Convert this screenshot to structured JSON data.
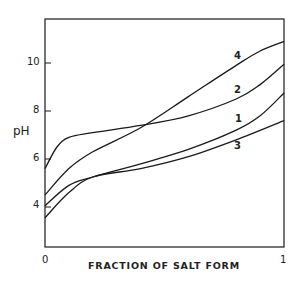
{
  "chart_data": {
    "type": "line",
    "title": "",
    "xlabel": "FRACTION OF SALT FORM",
    "ylabel": "pH",
    "xlim": [
      0,
      1
    ],
    "ylim": [
      2.3,
      11.8
    ],
    "grid": false,
    "legend": "inline curve labels near right end",
    "x_ticks": [
      "0",
      "1"
    ],
    "y_ticks": [
      "4",
      "6",
      "8",
      "10"
    ],
    "series": [
      {
        "name": "1",
        "x": [
          0,
          0.1,
          0.2,
          0.4,
          0.6,
          0.8,
          0.9,
          1.0
        ],
        "y": [
          4.05,
          4.9,
          5.25,
          5.8,
          6.4,
          7.2,
          7.8,
          8.75
        ]
      },
      {
        "name": "2",
        "x": [
          0,
          0.05,
          0.1,
          0.2,
          0.4,
          0.6,
          0.8,
          0.9,
          1.0
        ],
        "y": [
          5.6,
          6.5,
          6.9,
          7.1,
          7.4,
          7.8,
          8.5,
          9.1,
          9.95
        ]
      },
      {
        "name": "3",
        "x": [
          0,
          0.1,
          0.2,
          0.4,
          0.6,
          0.8,
          1.0
        ],
        "y": [
          3.55,
          4.6,
          5.25,
          5.6,
          6.1,
          6.8,
          7.6
        ]
      },
      {
        "name": "4",
        "x": [
          0,
          0.1,
          0.2,
          0.4,
          0.6,
          0.8,
          0.9,
          1.0
        ],
        "y": [
          4.5,
          5.6,
          6.3,
          7.3,
          8.6,
          9.9,
          10.5,
          10.9
        ]
      }
    ]
  },
  "labels": {
    "ylabel": "pH",
    "xlabel": "FRACTION OF SALT FORM",
    "yticks": {
      "t4": "4",
      "t6": "6",
      "t8": "8",
      "t10": "10"
    },
    "xticks": {
      "t0": "0",
      "t1": "1"
    },
    "curves": {
      "c1": "1",
      "c2": "2",
      "c3": "3",
      "c4": "4"
    }
  },
  "style": {
    "line_color": "#1a1a1a",
    "background": "#ffffff"
  }
}
